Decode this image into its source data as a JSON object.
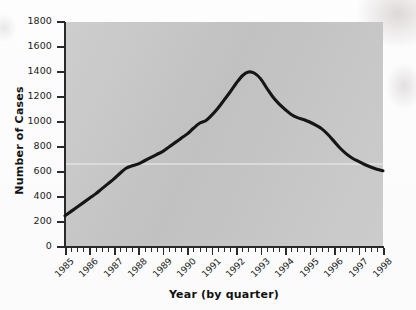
{
  "chart_data": {
    "type": "line",
    "title": "",
    "xlabel": "Year (by quarter)",
    "ylabel": "Number of Cases",
    "ylim": [
      0,
      1800
    ],
    "xlim": [
      1985,
      1998
    ],
    "grid": false,
    "legend": false,
    "ytick_labels": [
      "0",
      "200",
      "400",
      "600",
      "800",
      "1000",
      "1200",
      "1400",
      "1600",
      "1800"
    ],
    "ytick_values": [
      0,
      200,
      400,
      600,
      800,
      1000,
      1200,
      1400,
      1600,
      1800
    ],
    "xtick_labels": [
      "1985",
      "1986",
      "1987",
      "1988",
      "1989",
      "1990",
      "1991",
      "1992",
      "1993",
      "1994",
      "1995",
      "1996",
      "1997",
      "1998"
    ],
    "xtick_values": [
      1985,
      1986,
      1987,
      1988,
      1989,
      1990,
      1991,
      1992,
      1993,
      1994,
      1995,
      1996,
      1997,
      1998
    ],
    "minor_ticks_per_year": 4,
    "series": [
      {
        "name": "Number of Cases",
        "color": "#161616",
        "x": [
          1985.0,
          1985.25,
          1985.5,
          1985.75,
          1986.0,
          1986.25,
          1986.5,
          1986.75,
          1987.0,
          1987.25,
          1987.5,
          1987.75,
          1988.0,
          1988.25,
          1988.5,
          1988.75,
          1989.0,
          1989.25,
          1989.5,
          1989.75,
          1990.0,
          1990.25,
          1990.5,
          1990.75,
          1991.0,
          1991.25,
          1991.5,
          1991.75,
          1992.0,
          1992.25,
          1992.5,
          1992.75,
          1993.0,
          1993.25,
          1993.5,
          1993.75,
          1994.0,
          1994.25,
          1994.5,
          1994.75,
          1995.0,
          1995.25,
          1995.5,
          1995.75,
          1996.0,
          1996.25,
          1996.5,
          1996.75,
          1997.0,
          1997.25,
          1997.5,
          1997.75,
          1998.0
        ],
        "y": [
          250,
          285,
          320,
          355,
          390,
          425,
          465,
          505,
          545,
          590,
          630,
          650,
          665,
          690,
          715,
          740,
          765,
          800,
          835,
          870,
          905,
          950,
          990,
          1010,
          1055,
          1110,
          1175,
          1240,
          1310,
          1370,
          1400,
          1390,
          1345,
          1270,
          1200,
          1145,
          1100,
          1060,
          1035,
          1020,
          1000,
          975,
          945,
          900,
          845,
          790,
          745,
          710,
          685,
          660,
          640,
          622,
          610
        ]
      }
    ],
    "annotations": {
      "peak_value": 1400,
      "peak_year": 1992.5,
      "start_value": 250,
      "end_value": 610
    }
  },
  "colors": {
    "plot_background": "#c8c8c8",
    "page_background": "#ffffff",
    "axis": "#2a2a2a",
    "line": "#161616",
    "text": "#1b1b1b"
  }
}
